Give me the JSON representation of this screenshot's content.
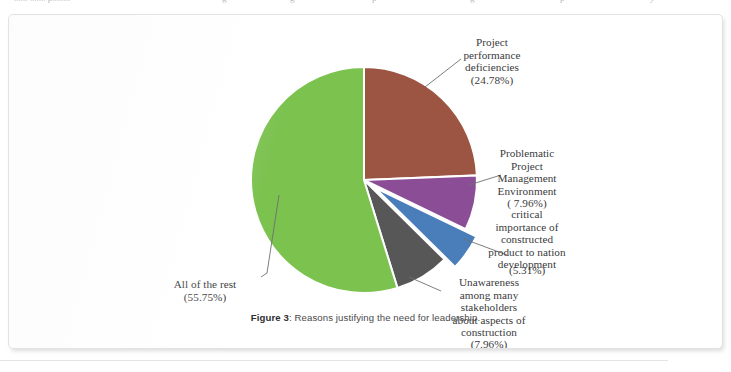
{
  "page": {
    "cutoff_fragments": [
      "......  ....... p........",
      "g",
      "g",
      "p",
      "g",
      "p",
      "y"
    ],
    "caption_prefix": "Figure 3",
    "caption_text": ": Reasons justifying the need for leadership."
  },
  "chart_data": {
    "type": "pie",
    "title": "Reasons justifying the need for leadership",
    "legend": "none",
    "start_angle_deg": 0,
    "rotation": "first slice begins at 12 o'clock, clockwise",
    "categories": [
      "Project performance deficiencies",
      "Problematic Project Management Environment",
      "critical importance of constructed product to nation development",
      "Unawareness among many stakeholders about aspects of construction",
      "All of the rest"
    ],
    "values": [
      24.78,
      7.96,
      5.31,
      7.96,
      55.75
    ],
    "unit": "percent",
    "slices": [
      {
        "name": "Project performance deficiencies",
        "value": 24.78,
        "value_label": "(24.78%)",
        "color": "#9C5542",
        "exploded": false,
        "label_lines": [
          "Project",
          "performance",
          "deficiencies"
        ]
      },
      {
        "name": "Problematic Project Management Environment",
        "value": 7.96,
        "value_label": "( 7.96%)",
        "color": "#8B4D96",
        "exploded": false,
        "label_lines": [
          "Problematic",
          "Project",
          "Management",
          "Environment"
        ]
      },
      {
        "name": "critical importance of constructed product to nation development",
        "value": 5.31,
        "value_label": "(5.31%)",
        "color": "#4A7EBB",
        "exploded": true,
        "label_lines": [
          "critical",
          "importance of",
          "constructed",
          "product to nation",
          "development"
        ]
      },
      {
        "name": "Unawareness among many stakeholders about aspects of construction",
        "value": 7.96,
        "value_label": "(7.96%)",
        "color": "#575757",
        "exploded": false,
        "label_lines": [
          "Unawareness",
          "among many",
          "stakeholders",
          "about aspects of",
          "construction"
        ]
      },
      {
        "name": "All of the rest",
        "value": 55.75,
        "value_label": "(55.75%)",
        "color": "#7BC24F",
        "exploded": false,
        "label_lines": [
          "All of the rest"
        ]
      }
    ],
    "colors": {
      "project_performance_deficiencies": "#9C5542",
      "problematic_pm_environment": "#8B4D96",
      "critical_importance": "#4A7EBB",
      "unawareness": "#575757",
      "all_of_the_rest": "#7BC24F",
      "slice_border": "#FFFFFF",
      "leader_line": "#6f6f72"
    }
  }
}
